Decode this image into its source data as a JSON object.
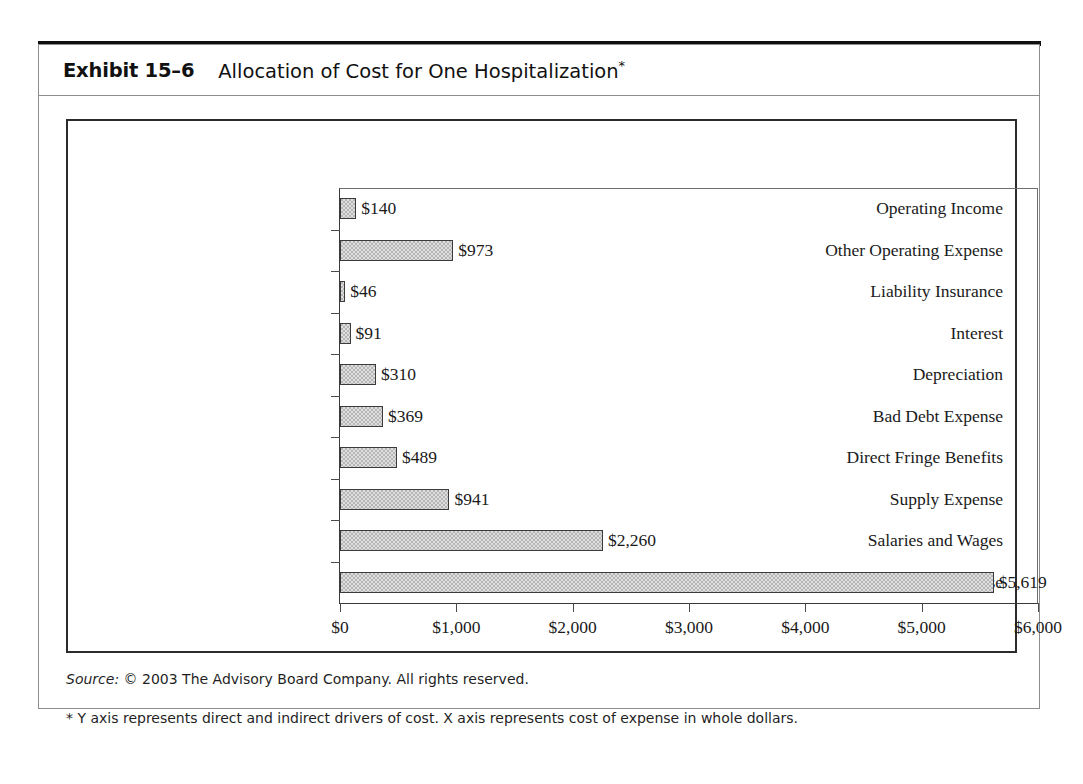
{
  "exhibit": {
    "number": "Exhibit 15–6",
    "title": "Allocation of Cost for One Hospitalization",
    "title_asterisk": "*"
  },
  "footer": {
    "source_label": "Source:",
    "source_text": " © 2003 The Advisory Board Company. All rights reserved.",
    "footnote": "* Y axis represents direct and indirect drivers of cost. X axis represents cost of expense in whole dollars."
  },
  "chart_data": {
    "type": "bar",
    "orientation": "horizontal",
    "title": "Allocation of Cost for One Hospitalization",
    "xlabel": "",
    "ylabel": "",
    "xlim": [
      0,
      6000
    ],
    "grid": false,
    "legend": "none",
    "bar_color": "#b6b6b6",
    "bar_border_color": "#3b3b3b",
    "categories": [
      "Operating Income",
      "Other Operating Expense",
      "Liability Insurance",
      "Interest",
      "Depreciation",
      "Bad Debt Expense",
      "Direct Fringe Benefits",
      "Supply Expense",
      "Salaries and Wages",
      "Total Operating Expense"
    ],
    "values": [
      140,
      973,
      46,
      91,
      310,
      369,
      489,
      941,
      2260,
      5619
    ],
    "value_labels": [
      "$140",
      "$973",
      "$46",
      "$91",
      "$310",
      "$369",
      "$489",
      "$941",
      "$2,260",
      "$5,619"
    ],
    "xticks": [
      0,
      1000,
      2000,
      3000,
      4000,
      5000,
      6000
    ],
    "xtick_labels": [
      "$0",
      "$1,000",
      "$2,000",
      "$3,000",
      "$4,000",
      "$5,000",
      "$6,000"
    ]
  }
}
